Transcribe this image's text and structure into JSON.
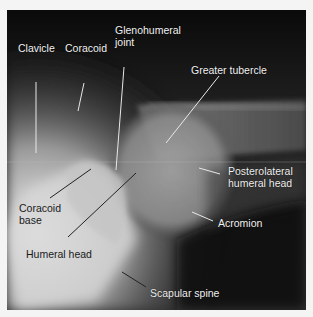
{
  "figure": {
    "labels": [
      {
        "id": "clavicle",
        "text": "Clavicle",
        "x": 11,
        "y": 32,
        "tone": "light"
      },
      {
        "id": "coracoid",
        "text": "Coracoid",
        "x": 57,
        "y": 32,
        "tone": "light"
      },
      {
        "id": "glenohumeral-joint",
        "line1": "Glenohumeral",
        "line2": "joint",
        "x": 108,
        "y": 14,
        "tone": "light"
      },
      {
        "id": "greater-tubercle",
        "text": "Greater tubercle",
        "x": 191,
        "y": 57,
        "tone": "light"
      },
      {
        "id": "posterolateral-humeral-head",
        "line1": "Posterolateral",
        "line2": "humeral head",
        "x": 228,
        "y": 168,
        "tone": "light"
      },
      {
        "id": "coracoid-base",
        "line1": "Coracoid",
        "line2": "base",
        "x": 13,
        "y": 200,
        "tone": "dark"
      },
      {
        "id": "acromion",
        "text": "Acromion",
        "x": 218,
        "y": 215,
        "tone": "light"
      },
      {
        "id": "humeral-head",
        "text": "Humeral head",
        "x": 20,
        "y": 242,
        "tone": "dark"
      },
      {
        "id": "scapular-spine",
        "text": "Scapular spine",
        "x": 145,
        "y": 285,
        "tone": "light"
      }
    ]
  }
}
